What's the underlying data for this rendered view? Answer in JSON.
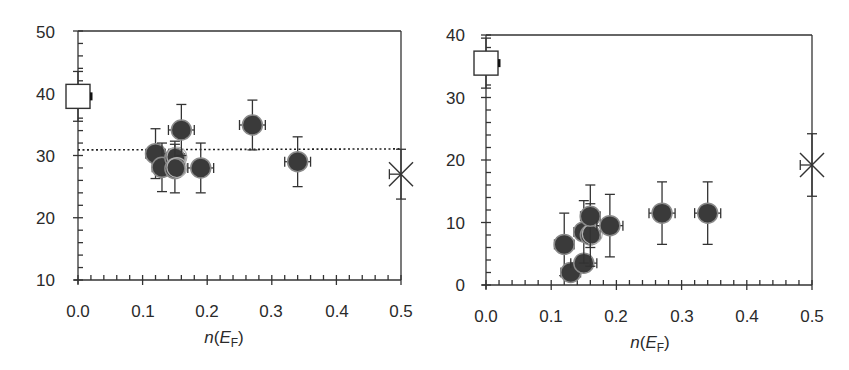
{
  "chart_data": [
    {
      "type": "scatter",
      "title": "",
      "xlabel": "n(E_F)",
      "ylabel": "",
      "xlim": [
        0.0,
        0.5
      ],
      "ylim": [
        10,
        50
      ],
      "xticks": [
        "0.0",
        "0.1",
        "0.2",
        "0.3",
        "0.4",
        "0.5"
      ],
      "yticks": [
        "10",
        "20",
        "30",
        "40",
        "50"
      ],
      "grid": false,
      "legend": null,
      "reference_line": {
        "style": "dotted",
        "y": 30.9
      },
      "series": [
        {
          "name": "filled circles",
          "marker": "filled-circle",
          "points": [
            {
              "x": 0.12,
              "y": 30.3,
              "xerr": 0.015,
              "yerr": 4.0
            },
            {
              "x": 0.13,
              "y": 28.1,
              "xerr": 0.015,
              "yerr": 3.9
            },
            {
              "x": 0.15,
              "y": 29.6,
              "xerr": 0.015,
              "yerr": 2.7,
              "hollow_overlay": true
            },
            {
              "x": 0.15,
              "y": 27.9,
              "xerr": 0.015,
              "yerr": 3.9,
              "hollow_overlay": true
            },
            {
              "x": 0.16,
              "y": 34.1,
              "xerr": 0.02,
              "yerr": 4.1
            },
            {
              "x": 0.19,
              "y": 28.0,
              "xerr": 0.02,
              "yerr": 4.0
            },
            {
              "x": 0.27,
              "y": 34.9,
              "xerr": 0.02,
              "yerr": 4.0
            },
            {
              "x": 0.34,
              "y": 29.0,
              "xerr": 0.02,
              "yerr": 4.0
            }
          ]
        },
        {
          "name": "open square",
          "marker": "open-square",
          "points": [
            {
              "x": 0.0,
              "y": 39.5,
              "yerr": 4.0
            }
          ]
        },
        {
          "name": "cross",
          "marker": "x-cross",
          "points": [
            {
              "x": 0.5,
              "y": 27.0,
              "xerr_left": 0.018,
              "yerr": 4.0
            }
          ]
        }
      ]
    },
    {
      "type": "scatter",
      "title": "",
      "xlabel": "n(E_F)",
      "ylabel": "",
      "xlim": [
        0.0,
        0.5
      ],
      "ylim": [
        0,
        40
      ],
      "xticks": [
        "0.0",
        "0.1",
        "0.2",
        "0.3",
        "0.4",
        "0.5"
      ],
      "yticks": [
        "0",
        "10",
        "20",
        "30",
        "40"
      ],
      "grid": false,
      "legend": null,
      "series": [
        {
          "name": "filled circles",
          "marker": "filled-circle",
          "points": [
            {
              "x": 0.12,
              "y": 6.5,
              "xerr": 0.015,
              "yerr": 5.0
            },
            {
              "x": 0.13,
              "y": 2.0,
              "xerr": 0.015,
              "yerr": 1.0
            },
            {
              "x": 0.15,
              "y": 3.5,
              "xerr": 0.02,
              "yerr": 1.0
            },
            {
              "x": 0.15,
              "y": 8.5,
              "xerr": 0.015,
              "yerr": 5.0
            },
            {
              "x": 0.16,
              "y": 8.0,
              "xerr": 0.015,
              "yerr": 5.0,
              "hollow_overlay": true
            },
            {
              "x": 0.16,
              "y": 11.0,
              "xerr": 0.015,
              "yerr": 5.0
            },
            {
              "x": 0.19,
              "y": 9.5,
              "xerr": 0.02,
              "yerr": 5.0
            },
            {
              "x": 0.27,
              "y": 11.5,
              "xerr": 0.02,
              "yerr": 5.0
            },
            {
              "x": 0.34,
              "y": 11.5,
              "xerr": 0.02,
              "yerr": 5.0
            }
          ]
        },
        {
          "name": "open square",
          "marker": "open-square",
          "points": [
            {
              "x": 0.0,
              "y": 35.5,
              "yerr": 4.0
            }
          ]
        },
        {
          "name": "cross",
          "marker": "x-cross",
          "points": [
            {
              "x": 0.5,
              "y": 19.2,
              "xerr_left": 0.018,
              "yerr": 5.0
            }
          ]
        }
      ]
    }
  ],
  "labels": {
    "left": {
      "xlabel_n": "n",
      "xlabel_E": "E",
      "xlabel_sub": "F",
      "xticks": [
        "0.0",
        "0.1",
        "0.2",
        "0.3",
        "0.4",
        "0.5"
      ],
      "yticks": [
        "10",
        "20",
        "30",
        "40",
        "50"
      ]
    },
    "right": {
      "xlabel_n": "n",
      "xlabel_E": "E",
      "xlabel_sub": "F",
      "xticks": [
        "0.0",
        "0.1",
        "0.2",
        "0.3",
        "0.4",
        "0.5"
      ],
      "yticks": [
        "0",
        "10",
        "20",
        "30",
        "40"
      ]
    }
  },
  "colors": {
    "axis": "#333333",
    "marker_fill": "#3a3a3a",
    "marker_edge": "#8a8a8a",
    "text": "#2a2a2a"
  }
}
